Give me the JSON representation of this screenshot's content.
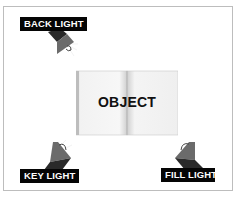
{
  "diagram": {
    "object": {
      "label": "OBJECT",
      "icon": "open-book-icon"
    },
    "lights": [
      {
        "label": "BACK LIGHT",
        "position": "top-left",
        "icon": "spotlight-icon"
      },
      {
        "label": "KEY LIGHT",
        "position": "bottom-left",
        "icon": "spotlight-icon"
      },
      {
        "label": "FILL LIGHT",
        "position": "bottom-right",
        "icon": "spotlight-icon"
      }
    ],
    "colors": {
      "label_bg": "#050505",
      "label_text": "#ffffff",
      "lamp_dark": "#2a2a2a",
      "lamp_mid": "#6b6b6b",
      "book_page": "#f4f4f4",
      "frame_border": "#bdbdbd"
    }
  }
}
